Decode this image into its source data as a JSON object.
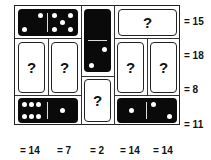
{
  "puzzle": {
    "row_sums": [
      "= 15",
      "= 18",
      "= 8",
      "= 11"
    ],
    "col_sums": [
      "= 14",
      "= 7",
      "= 2",
      "= 14",
      "= 14"
    ],
    "unknown_mark": "?",
    "dominoes": [
      {
        "id": "top-left",
        "orientation": "horizontal",
        "revealed": true,
        "values": [
          2,
          5
        ]
      },
      {
        "id": "center-top",
        "orientation": "vertical",
        "revealed": true,
        "values": [
          0,
          2
        ]
      },
      {
        "id": "top-right",
        "orientation": "horizontal",
        "revealed": false
      },
      {
        "id": "mid-col1",
        "orientation": "vertical",
        "revealed": false
      },
      {
        "id": "mid-col2",
        "orientation": "vertical",
        "revealed": false
      },
      {
        "id": "center-bottom",
        "orientation": "vertical",
        "revealed": false
      },
      {
        "id": "mid-col4",
        "orientation": "vertical",
        "revealed": false
      },
      {
        "id": "mid-col5",
        "orientation": "vertical",
        "revealed": false
      },
      {
        "id": "bottom-left",
        "orientation": "horizontal",
        "revealed": true,
        "values": [
          6,
          1
        ]
      },
      {
        "id": "bottom-right",
        "orientation": "horizontal",
        "revealed": true,
        "values": [
          1,
          2
        ]
      }
    ]
  }
}
